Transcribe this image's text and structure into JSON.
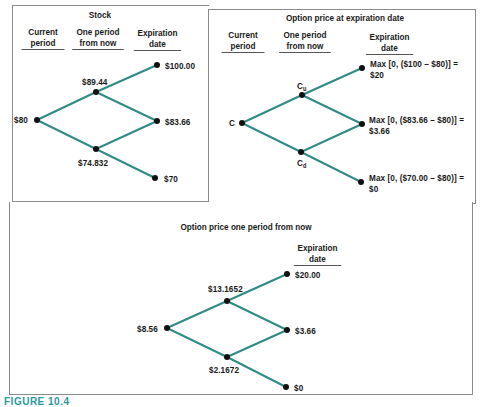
{
  "line_color": "#2e8b86",
  "node_color": "#111111",
  "panels": {
    "stock": {
      "title": "Stock",
      "headers": [
        "Current period",
        "One period from now",
        "Expiration date"
      ],
      "nodes": {
        "root": "$80",
        "up": "$89.44",
        "down": "$74.832",
        "uu": "$100.00",
        "ud": "$83.66",
        "dd": "$70"
      }
    },
    "option_expiration": {
      "title": "Option price at expiration date",
      "headers": [
        "Current period",
        "One period from now",
        "Expiration date"
      ],
      "nodes": {
        "root": "C",
        "up_base": "C",
        "up_sub": "u",
        "down_base": "C",
        "down_sub": "d",
        "uu_line1": "Max [0, ($100 – $80)] =",
        "uu_line2": "$20",
        "ud_line1": "Max [0, ($83.66 – $80)] =",
        "ud_line2": "$3.66",
        "dd_line1": "Max [0, ($70.00 – $80)] =",
        "dd_line2": "$0"
      }
    },
    "option_one_period": {
      "title": "Option price one period from now",
      "headers": [
        "Expiration date"
      ],
      "nodes": {
        "root": "$8.56",
        "up": "$13.1652",
        "down": "$2.1672",
        "uu": "$20.00",
        "ud": "$3.66",
        "dd": "$0"
      }
    }
  },
  "caption": "FIGURE 10.4"
}
